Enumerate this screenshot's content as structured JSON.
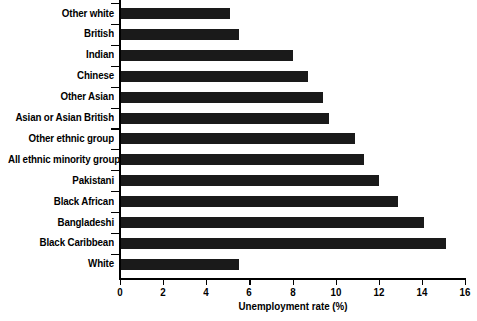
{
  "chart_data": {
    "type": "bar",
    "orientation": "horizontal",
    "title": "",
    "xlabel": "Unemployment rate (%)",
    "ylabel": "",
    "xlim": [
      0,
      16
    ],
    "xticks": [
      "0",
      "2",
      "4",
      "6",
      "8",
      "10",
      "12",
      "14",
      "16"
    ],
    "xtick_values": [
      0,
      2,
      4,
      6,
      8,
      10,
      12,
      14,
      16
    ],
    "grid": false,
    "legend": "none",
    "bar_color": "#1a1a1a",
    "axis_color": "#000000",
    "background": "#ffffff",
    "categories": [
      "Other white",
      "British",
      "Indian",
      "Chinese",
      "Other Asian",
      "Asian or Asian British",
      "Other ethnic group",
      "All ethnic minority groups",
      "Pakistani",
      "Black African",
      "Bangladeshi",
      "Black Caribbean",
      "White"
    ],
    "values": [
      5.1,
      5.5,
      8.0,
      8.7,
      9.4,
      9.7,
      10.9,
      11.3,
      12.0,
      12.9,
      14.1,
      15.1,
      5.5
    ]
  }
}
